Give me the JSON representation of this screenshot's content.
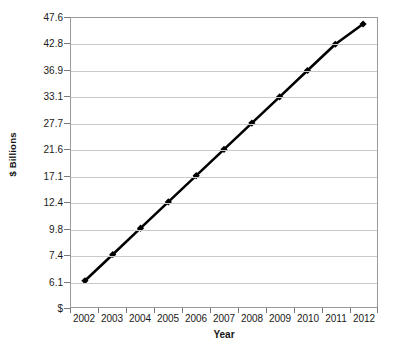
{
  "chart_data": {
    "type": "line",
    "title": "",
    "xlabel": "Year",
    "ylabel": "$ Billions",
    "categories": [
      "2002",
      "2003",
      "2004",
      "2005",
      "2006",
      "2007",
      "2008",
      "2009",
      "2010",
      "2011",
      "2012"
    ],
    "values": [
      6.1,
      7.4,
      9.8,
      12.4,
      17.1,
      21.6,
      27.7,
      33.1,
      36.9,
      42.8,
      46.5
    ],
    "series": [
      {
        "name": "$ Billions",
        "values": [
          6.1,
          7.4,
          9.8,
          12.4,
          17.1,
          21.6,
          27.7,
          33.1,
          36.9,
          42.8,
          46.5
        ]
      }
    ],
    "y_tick_labels": [
      "$",
      "6.1",
      "7.4",
      "9.8",
      "12.4",
      "17.1",
      "21.6",
      "27.7",
      "33.1",
      "36.9",
      "42.8",
      "47.6"
    ],
    "x_tick_labels": [
      "2002",
      "2003",
      "2004",
      "2005",
      "2006",
      "2007",
      "2008",
      "2009",
      "2010",
      "2011",
      "2012"
    ],
    "grid": true,
    "legend": false,
    "legend_position": "none",
    "line_color": "#000000",
    "marker_color": "#000000",
    "marker_shape": "diamond",
    "gridline_color": "#c9c9c9",
    "axis_color": "#9a9a9a",
    "background_color": "#ffffff"
  }
}
